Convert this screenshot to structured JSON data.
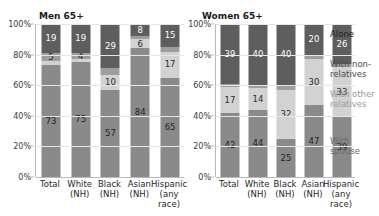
{
  "clipped_title": "Living arrangements of people age 65 and over, 2010",
  "panels": [
    {
      "id": "men",
      "title": "Men 65+"
    },
    {
      "id": "women",
      "title": "Women 65+"
    }
  ],
  "yaxis": {
    "ticks": [
      "100%",
      "80%",
      "60%",
      "40%",
      "20%",
      "0%"
    ],
    "tick_values": [
      100,
      80,
      60,
      40,
      20,
      0
    ],
    "min": 0,
    "max": 100
  },
  "categories": [
    {
      "line1": "Total",
      "line2": ""
    },
    {
      "line1": "White",
      "line2": "(NH)"
    },
    {
      "line1": "Black",
      "line2": "(NH)"
    },
    {
      "line1": "Asian",
      "line2": "(NH)"
    },
    {
      "line1": "Hispanic",
      "line2": "(any race)"
    }
  ],
  "legend": {
    "alone": "Alone",
    "nonrelatives": "With non-relatives",
    "other_relatives": "With other relatives",
    "spouse": "With spouse"
  },
  "colors": {
    "alone": "#5e5e5e",
    "nonrelatives": "#9e9e9e",
    "other_relatives": "#d2d2d2",
    "spouse": "#8a8a8a",
    "gridline": "#e6e6e6",
    "axis": "#b9b9b9",
    "text": "#1f1f1f",
    "background": "#ffffff"
  },
  "chart_data": {
    "type": "bar",
    "title": "Living arrangements of people age 65 and over",
    "xlabel": "",
    "ylabel": "",
    "ylim": [
      0,
      100
    ],
    "stacked": true,
    "grid": true,
    "legend_position": "right",
    "categories": [
      "Total",
      "White (NH)",
      "Black (NH)",
      "Asian (NH)",
      "Hispanic (any race)"
    ],
    "panels": [
      {
        "name": "Men 65+",
        "series": [
          {
            "name": "With spouse",
            "values": [
              73,
              75,
              57,
              84,
              65
            ],
            "labels": [
              "73",
              "75",
              "57",
              "84",
              "65"
            ],
            "show_label": [
              true,
              true,
              true,
              true,
              true
            ]
          },
          {
            "name": "With other relatives",
            "values": [
              3,
              2,
              10,
              6,
              17
            ],
            "labels": [
              "",
              "",
              "10",
              "6",
              "17"
            ],
            "show_label": [
              false,
              false,
              true,
              true,
              true
            ]
          },
          {
            "name": "With non-relatives",
            "values": [
              5,
              4,
              4,
              2,
              3
            ],
            "labels": [
              "5",
              "4",
              "",
              "",
              ""
            ],
            "show_label": [
              true,
              true,
              false,
              false,
              false
            ]
          },
          {
            "name": "Alone",
            "values": [
              19,
              19,
              29,
              8,
              15
            ],
            "labels": [
              "19",
              "19",
              "29",
              "8",
              "15"
            ],
            "show_label": [
              true,
              true,
              true,
              true,
              true
            ]
          }
        ]
      },
      {
        "name": "Women 65+",
        "series": [
          {
            "name": "With spouse",
            "values": [
              42,
              44,
              25,
              47,
              39
            ],
            "labels": [
              "42",
              "44",
              "25",
              "47",
              "39"
            ],
            "show_label": [
              true,
              true,
              true,
              true,
              true
            ]
          },
          {
            "name": "With other relatives",
            "values": [
              17,
              14,
              32,
              30,
              33
            ],
            "labels": [
              "17",
              "14",
              "32",
              "30",
              "33"
            ],
            "show_label": [
              true,
              true,
              true,
              true,
              true
            ]
          },
          {
            "name": "With non-relatives",
            "values": [
              2,
              2,
              3,
              3,
              2
            ],
            "labels": [
              "",
              "",
              "",
              "",
              ""
            ],
            "show_label": [
              false,
              false,
              false,
              false,
              false
            ]
          },
          {
            "name": "Alone",
            "values": [
              39,
              40,
              40,
              20,
              26
            ],
            "labels": [
              "39",
              "40",
              "40",
              "20",
              "26"
            ],
            "show_label": [
              true,
              true,
              true,
              true,
              true
            ]
          }
        ]
      }
    ]
  }
}
